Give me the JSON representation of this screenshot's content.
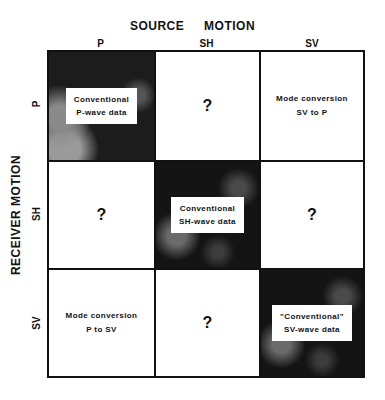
{
  "header": {
    "title_word1": "SOURCE",
    "title_word2": "MOTION"
  },
  "columns": [
    "P",
    "SH",
    "SV"
  ],
  "row_axis_title": "RECEIVER MOTION",
  "rows": [
    "P",
    "SH",
    "SV"
  ],
  "cells": [
    [
      {
        "type": "boxed",
        "line1": "Conventional",
        "line2": "P-wave data"
      },
      {
        "type": "question",
        "text": "?"
      },
      {
        "type": "plain",
        "line1": "Mode conversion",
        "line2": "SV to P"
      }
    ],
    [
      {
        "type": "question",
        "text": "?"
      },
      {
        "type": "boxed",
        "line1": "Conventional",
        "line2": "SH-wave data"
      },
      {
        "type": "question",
        "text": "?"
      }
    ],
    [
      {
        "type": "plain",
        "line1": "Mode conversion",
        "line2": "P to SV"
      },
      {
        "type": "question",
        "text": "?"
      },
      {
        "type": "boxed",
        "line1": "\"Conventional\"",
        "line2": "SV-wave data"
      }
    ]
  ],
  "colors": {
    "dark_cell": "#141414",
    "line": "#111111",
    "background": "#ffffff"
  }
}
